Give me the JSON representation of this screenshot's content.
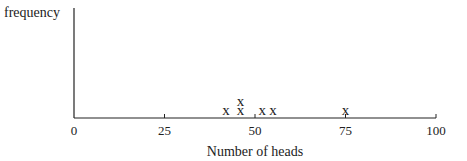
{
  "chart_data": {
    "type": "scatter",
    "subtype": "dot-plot",
    "title": "",
    "xlabel": "Number of heads",
    "ylabel": "frequency",
    "xlim": [
      0,
      100
    ],
    "x_ticks": [
      0,
      25,
      50,
      75,
      100
    ],
    "x_tick_labels": [
      "0",
      "25",
      "50",
      "75",
      "100"
    ],
    "marker": "x",
    "grid": false,
    "legend": null,
    "points": [
      {
        "x": 42,
        "count": 1
      },
      {
        "x": 46,
        "count": 2
      },
      {
        "x": 52,
        "count": 1
      },
      {
        "x": 55,
        "count": 1
      },
      {
        "x": 75,
        "count": 1
      }
    ],
    "colors": {
      "axis": "#222222",
      "marker": "#222222"
    }
  }
}
